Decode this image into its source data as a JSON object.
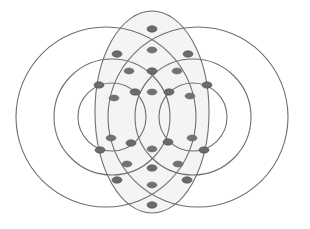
{
  "diagram": {
    "colors": {
      "stroke": "#6f6f6f",
      "node_fill": "#6b6b6b",
      "background": "#ffffff",
      "inner_shade": "#f4f4f4"
    },
    "shapes": {
      "ellipse": {
        "cx": 152,
        "cy": 112,
        "rx": 57,
        "ry": 101
      },
      "circles": [
        {
          "name": "outer-left",
          "cx": 152,
          "cy": 117,
          "r": 136,
          "shift": -72
        },
        {
          "name": "outer-right",
          "cx": 152,
          "cy": 117,
          "r": 136,
          "shift": 72
        }
      ],
      "circle_list": [
        {
          "id": "outer-left",
          "cx": 152,
          "cy": 117,
          "r": 137
        },
        {
          "id": "outer-right",
          "cx": 153,
          "cy": 117,
          "r": 137
        },
        {
          "id": "middle-left",
          "cx": 112,
          "cy": 117,
          "r": 72
        },
        {
          "id": "middle-right",
          "cx": 193,
          "cy": 117,
          "r": 72
        },
        {
          "id": "inner-left",
          "cx": 112,
          "cy": 117,
          "r": 34
        },
        {
          "id": "inner-right",
          "cx": 193,
          "cy": 117,
          "r": 34
        }
      ]
    },
    "intersection_nodes": [
      {
        "x": 152,
        "y": 29
      },
      {
        "x": 117,
        "y": 54
      },
      {
        "x": 188,
        "y": 54
      },
      {
        "x": 152,
        "y": 71
      },
      {
        "x": 99,
        "y": 85
      },
      {
        "x": 207,
        "y": 85
      },
      {
        "x": 135,
        "y": 92
      },
      {
        "x": 169,
        "y": 92
      },
      {
        "x": 131,
        "y": 143
      },
      {
        "x": 168,
        "y": 142
      },
      {
        "x": 100,
        "y": 150
      },
      {
        "x": 204,
        "y": 150
      },
      {
        "x": 152,
        "y": 168
      },
      {
        "x": 117,
        "y": 180
      },
      {
        "x": 187,
        "y": 180
      },
      {
        "x": 152,
        "y": 205
      }
    ],
    "region_markers": [
      {
        "x": 152,
        "y": 50
      },
      {
        "x": 129,
        "y": 71
      },
      {
        "x": 177,
        "y": 71
      },
      {
        "x": 114,
        "y": 98
      },
      {
        "x": 152,
        "y": 92
      },
      {
        "x": 190,
        "y": 96
      },
      {
        "x": 111,
        "y": 138
      },
      {
        "x": 192,
        "y": 138
      },
      {
        "x": 152,
        "y": 149
      },
      {
        "x": 127,
        "y": 164
      },
      {
        "x": 178,
        "y": 164
      },
      {
        "x": 152,
        "y": 185
      }
    ]
  }
}
